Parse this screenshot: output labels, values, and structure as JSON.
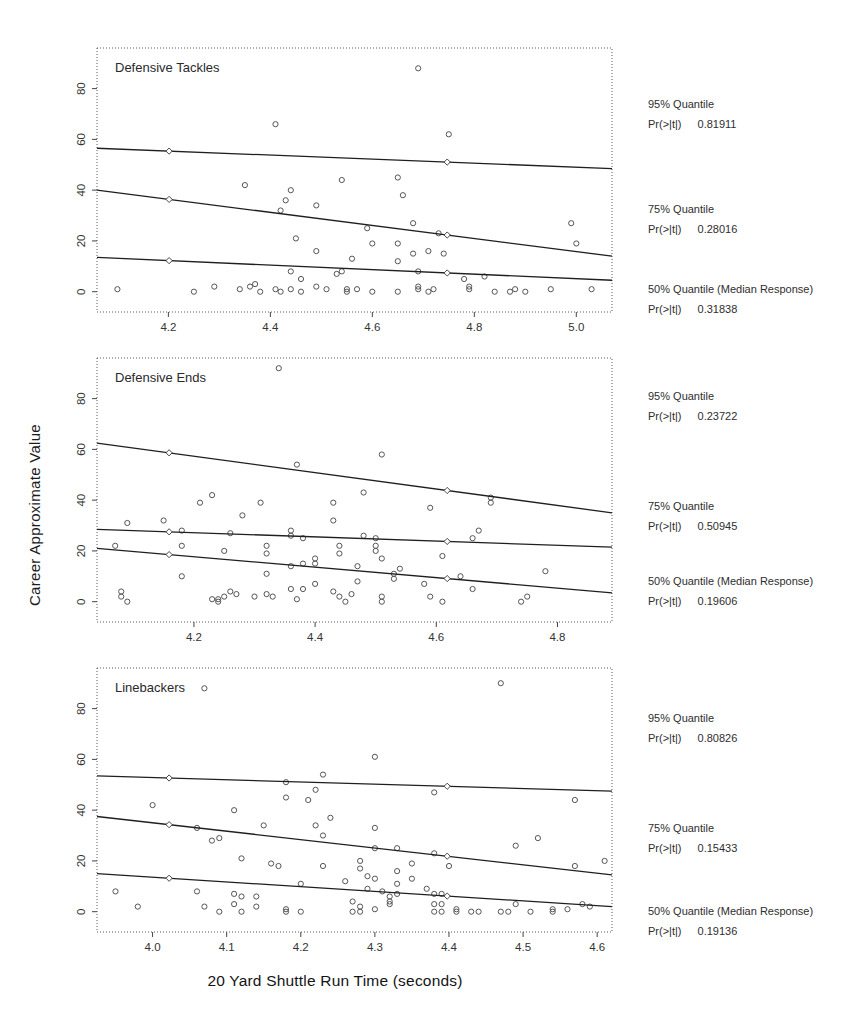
{
  "figure": {
    "xlabel": "20 Yard Shuttle Run Time (seconds)",
    "ylabel": "Career Approximate Value"
  },
  "chart_data": [
    {
      "type": "scatter",
      "title": "Defensive Tackles",
      "xlim": [
        4.06,
        5.07
      ],
      "ylim": [
        -8,
        96
      ],
      "xticks": [
        4.2,
        4.4,
        4.6,
        4.8,
        5.0
      ],
      "yticks": [
        0,
        20,
        40,
        60,
        80
      ],
      "grid": false,
      "lines": [
        {
          "name": "95% Quantile",
          "p_label": "Pr(>|t|)",
          "p_value": "0.81911",
          "x": [
            4.06,
            5.07
          ],
          "y": [
            56.5,
            48.5
          ]
        },
        {
          "name": "75% Quantile",
          "p_label": "Pr(>|t|)",
          "p_value": "0.28016",
          "x": [
            4.06,
            5.07
          ],
          "y": [
            40.0,
            14.0
          ]
        },
        {
          "name": "50% Quantile (Median Response)",
          "p_label": "Pr(>|t|)",
          "p_value": "0.31838",
          "x": [
            4.06,
            5.07
          ],
          "y": [
            13.5,
            4.5
          ]
        }
      ],
      "points": [
        [
          4.69,
          88
        ],
        [
          4.41,
          66
        ],
        [
          4.75,
          62
        ],
        [
          4.54,
          44
        ],
        [
          4.65,
          45
        ],
        [
          4.35,
          42
        ],
        [
          4.44,
          40
        ],
        [
          4.43,
          36
        ],
        [
          4.66,
          38
        ],
        [
          4.42,
          32
        ],
        [
          4.49,
          34
        ],
        [
          4.68,
          27
        ],
        [
          4.73,
          23
        ],
        [
          4.59,
          25
        ],
        [
          4.99,
          27
        ],
        [
          5.0,
          19
        ],
        [
          4.45,
          21
        ],
        [
          4.6,
          19
        ],
        [
          4.65,
          19
        ],
        [
          4.68,
          15
        ],
        [
          4.71,
          16
        ],
        [
          4.74,
          15
        ],
        [
          4.49,
          16
        ],
        [
          4.56,
          13
        ],
        [
          4.65,
          12
        ],
        [
          4.69,
          8
        ],
        [
          4.44,
          8
        ],
        [
          4.46,
          5
        ],
        [
          4.53,
          7
        ],
        [
          4.54,
          8
        ],
        [
          4.78,
          5
        ],
        [
          4.82,
          6
        ],
        [
          4.1,
          1
        ],
        [
          4.29,
          2
        ],
        [
          4.25,
          0
        ],
        [
          4.34,
          1
        ],
        [
          4.36,
          2
        ],
        [
          4.37,
          3
        ],
        [
          4.38,
          0
        ],
        [
          4.41,
          1
        ],
        [
          4.42,
          0
        ],
        [
          4.44,
          1
        ],
        [
          4.46,
          0
        ],
        [
          4.49,
          2
        ],
        [
          4.51,
          1
        ],
        [
          4.55,
          0
        ],
        [
          4.55,
          1
        ],
        [
          4.57,
          1
        ],
        [
          4.6,
          0
        ],
        [
          4.65,
          0
        ],
        [
          4.69,
          2
        ],
        [
          4.69,
          1
        ],
        [
          4.71,
          0
        ],
        [
          4.72,
          1
        ],
        [
          4.79,
          1
        ],
        [
          4.79,
          2
        ],
        [
          4.84,
          0
        ],
        [
          4.87,
          0
        ],
        [
          4.88,
          1
        ],
        [
          4.9,
          0
        ],
        [
          4.95,
          1
        ],
        [
          5.03,
          1
        ]
      ]
    },
    {
      "type": "scatter",
      "title": "Defensive Ends",
      "xlim": [
        4.04,
        4.89
      ],
      "ylim": [
        -8,
        96
      ],
      "xticks": [
        4.2,
        4.4,
        4.6,
        4.8
      ],
      "yticks": [
        0,
        20,
        40,
        60,
        80
      ],
      "grid": false,
      "lines": [
        {
          "name": "95% Quantile",
          "p_label": "Pr(>|t|)",
          "p_value": "0.23722",
          "x": [
            4.04,
            4.89
          ],
          "y": [
            62.5,
            35.0
          ]
        },
        {
          "name": "75% Quantile",
          "p_label": "Pr(>|t|)",
          "p_value": "0.50945",
          "x": [
            4.04,
            4.89
          ],
          "y": [
            28.5,
            21.5
          ]
        },
        {
          "name": "50% Quantile (Median Response)",
          "p_label": "Pr(>|t|)",
          "p_value": "0.19606",
          "x": [
            4.04,
            4.89
          ],
          "y": [
            21.0,
            3.5
          ]
        }
      ],
      "points": [
        [
          4.34,
          92
        ],
        [
          4.51,
          58
        ],
        [
          4.37,
          54
        ],
        [
          4.48,
          43
        ],
        [
          4.21,
          39
        ],
        [
          4.23,
          42
        ],
        [
          4.31,
          39
        ],
        [
          4.43,
          39
        ],
        [
          4.69,
          41
        ],
        [
          4.69,
          39
        ],
        [
          4.59,
          37
        ],
        [
          4.28,
          34
        ],
        [
          4.43,
          32
        ],
        [
          4.15,
          32
        ],
        [
          4.09,
          31
        ],
        [
          4.18,
          28
        ],
        [
          4.26,
          27
        ],
        [
          4.36,
          28
        ],
        [
          4.36,
          26
        ],
        [
          4.38,
          25
        ],
        [
          4.48,
          26
        ],
        [
          4.5,
          25
        ],
        [
          4.66,
          25
        ],
        [
          4.67,
          28
        ],
        [
          4.07,
          22
        ],
        [
          4.18,
          22
        ],
        [
          4.25,
          20
        ],
        [
          4.32,
          22
        ],
        [
          4.32,
          19
        ],
        [
          4.44,
          22
        ],
        [
          4.44,
          19
        ],
        [
          4.5,
          22
        ],
        [
          4.5,
          20
        ],
        [
          4.4,
          17
        ],
        [
          4.4,
          15
        ],
        [
          4.51,
          17
        ],
        [
          4.61,
          18
        ],
        [
          4.47,
          14
        ],
        [
          4.54,
          13
        ],
        [
          4.36,
          14
        ],
        [
          4.38,
          15
        ],
        [
          4.78,
          12
        ],
        [
          4.18,
          10
        ],
        [
          4.32,
          11
        ],
        [
          4.53,
          11
        ],
        [
          4.53,
          9
        ],
        [
          4.58,
          7
        ],
        [
          4.64,
          10
        ],
        [
          4.47,
          8
        ],
        [
          4.36,
          5
        ],
        [
          4.38,
          5
        ],
        [
          4.4,
          7
        ],
        [
          4.66,
          5
        ],
        [
          4.08,
          4
        ],
        [
          4.08,
          2
        ],
        [
          4.09,
          0
        ],
        [
          4.23,
          1
        ],
        [
          4.24,
          0
        ],
        [
          4.24,
          1
        ],
        [
          4.25,
          2
        ],
        [
          4.26,
          4
        ],
        [
          4.27,
          3
        ],
        [
          4.3,
          2
        ],
        [
          4.32,
          3
        ],
        [
          4.33,
          2
        ],
        [
          4.37,
          1
        ],
        [
          4.43,
          4
        ],
        [
          4.44,
          2
        ],
        [
          4.45,
          0
        ],
        [
          4.46,
          3
        ],
        [
          4.51,
          2
        ],
        [
          4.51,
          0
        ],
        [
          4.59,
          2
        ],
        [
          4.61,
          0
        ],
        [
          4.74,
          0
        ],
        [
          4.75,
          2
        ]
      ]
    },
    {
      "type": "scatter",
      "title": "Linebackers",
      "xlim": [
        3.925,
        4.62
      ],
      "ylim": [
        -8,
        96
      ],
      "xticks": [
        4.0,
        4.1,
        4.2,
        4.3,
        4.4,
        4.5,
        4.6
      ],
      "yticks": [
        0,
        20,
        40,
        60,
        80
      ],
      "grid": false,
      "lines": [
        {
          "name": "95% Quantile",
          "p_label": "Pr(>|t|)",
          "p_value": "0.80826",
          "x": [
            3.925,
            4.62
          ],
          "y": [
            53.5,
            47.5
          ]
        },
        {
          "name": "75% Quantile",
          "p_label": "Pr(>|t|)",
          "p_value": "0.15433",
          "x": [
            3.925,
            4.62
          ],
          "y": [
            37.5,
            14.5
          ]
        },
        {
          "name": "50% Quantile (Median Response)",
          "p_label": "Pr(>|t|)",
          "p_value": "0.19136",
          "x": [
            3.925,
            4.62
          ],
          "y": [
            15.0,
            2.0
          ]
        }
      ],
      "points": [
        [
          4.47,
          90
        ],
        [
          4.07,
          88
        ],
        [
          4.3,
          61
        ],
        [
          4.23,
          54
        ],
        [
          4.18,
          51
        ],
        [
          4.22,
          48
        ],
        [
          4.18,
          45
        ],
        [
          4.21,
          44
        ],
        [
          4.38,
          47
        ],
        [
          4.57,
          44
        ],
        [
          4.0,
          42
        ],
        [
          4.11,
          40
        ],
        [
          4.15,
          34
        ],
        [
          4.06,
          33
        ],
        [
          4.24,
          37
        ],
        [
          4.22,
          34
        ],
        [
          4.3,
          33
        ],
        [
          4.52,
          29
        ],
        [
          4.49,
          26
        ],
        [
          4.08,
          28
        ],
        [
          4.09,
          29
        ],
        [
          4.23,
          30
        ],
        [
          4.3,
          25
        ],
        [
          4.33,
          25
        ],
        [
          4.38,
          23
        ],
        [
          4.4,
          18
        ],
        [
          4.12,
          21
        ],
        [
          4.16,
          19
        ],
        [
          4.17,
          18
        ],
        [
          4.28,
          20
        ],
        [
          4.28,
          17
        ],
        [
          4.35,
          19
        ],
        [
          4.23,
          18
        ],
        [
          4.35,
          13
        ],
        [
          4.29,
          14
        ],
        [
          4.3,
          13
        ],
        [
          4.33,
          16
        ],
        [
          4.33,
          11
        ],
        [
          4.57,
          18
        ],
        [
          4.61,
          20
        ],
        [
          4.2,
          11
        ],
        [
          4.26,
          12
        ],
        [
          4.29,
          9
        ],
        [
          4.31,
          8
        ],
        [
          4.32,
          6
        ],
        [
          4.32,
          4
        ],
        [
          4.32,
          3
        ],
        [
          4.33,
          7
        ],
        [
          3.95,
          8
        ],
        [
          4.06,
          8
        ],
        [
          4.11,
          7
        ],
        [
          4.11,
          3
        ],
        [
          4.12,
          6
        ],
        [
          4.14,
          6
        ],
        [
          4.14,
          2
        ],
        [
          4.12,
          0
        ],
        [
          4.07,
          2
        ],
        [
          4.09,
          0
        ],
        [
          3.98,
          2
        ],
        [
          4.18,
          0
        ],
        [
          4.18,
          1
        ],
        [
          4.2,
          0
        ],
        [
          4.27,
          4
        ],
        [
          4.27,
          0
        ],
        [
          4.28,
          2
        ],
        [
          4.28,
          0
        ],
        [
          4.3,
          1
        ],
        [
          4.37,
          9
        ],
        [
          4.38,
          7
        ],
        [
          4.38,
          3
        ],
        [
          4.38,
          0
        ],
        [
          4.39,
          7
        ],
        [
          4.39,
          3
        ],
        [
          4.39,
          0
        ],
        [
          4.41,
          0
        ],
        [
          4.41,
          1
        ],
        [
          4.43,
          0
        ],
        [
          4.44,
          0
        ],
        [
          4.47,
          0
        ],
        [
          4.48,
          0
        ],
        [
          4.49,
          3
        ],
        [
          4.51,
          0
        ],
        [
          4.54,
          0
        ],
        [
          4.54,
          1
        ],
        [
          4.56,
          1
        ],
        [
          4.58,
          3
        ],
        [
          4.59,
          2
        ]
      ]
    }
  ]
}
